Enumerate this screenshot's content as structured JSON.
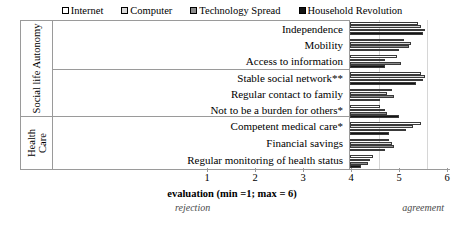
{
  "chart_data": {
    "type": "bar",
    "orientation": "horizontal",
    "title": "",
    "xlabel": "evaluation (min =1; max = 6)",
    "ylabel": "",
    "xlim": [
      1,
      6
    ],
    "xticks": [
      1,
      2,
      3,
      4,
      5,
      6
    ],
    "grid": true,
    "legend_position": "top",
    "scale_anchor_low": "rejection",
    "scale_anchor_high": "agreement",
    "groups": [
      {
        "name": "Social life Autonomy",
        "categories": [
          "Independence",
          "Mobility",
          "Access to information",
          "Stable social network**",
          "Regular contact to family",
          "Not to be a burden for others*"
        ]
      },
      {
        "name": "Health Care",
        "categories": [
          "Competent medical care*",
          "Financial savings",
          "Regular monitoring of health status"
        ]
      }
    ],
    "group_label_lines": [
      [
        "Social life Autonomy"
      ],
      [
        "Health",
        "Care"
      ]
    ],
    "categories": [
      "Independence",
      "Mobility",
      "Access to information",
      "Stable social network**",
      "Regular contact to family",
      "Not to be a burden for others*",
      "Competent medical care*",
      "Financial savings",
      "Regular monitoring of health status"
    ],
    "series": [
      {
        "name": "Internet",
        "color": "#ffffff",
        "values": [
          5.4,
          5.1,
          4.95,
          5.45,
          4.85,
          4.6,
          5.45,
          4.8,
          4.45
        ]
      },
      {
        "name": "Computer",
        "color": "#d9d9d9",
        "values": [
          5.45,
          5.25,
          4.7,
          5.55,
          4.75,
          4.7,
          5.3,
          4.85,
          4.4
        ]
      },
      {
        "name": "Technology Spread",
        "color": "#8c8c8c",
        "values": [
          5.55,
          5.2,
          5.05,
          5.5,
          4.9,
          4.75,
          5.15,
          4.9,
          4.35
        ]
      },
      {
        "name": "Household Revolution",
        "color": "#141414",
        "values": [
          5.5,
          5.0,
          4.7,
          5.35,
          4.6,
          5.0,
          4.8,
          4.7,
          4.2
        ]
      }
    ]
  },
  "legend": {
    "items": [
      {
        "label": "Internet",
        "swatch": "#ffffff"
      },
      {
        "label": "Computer",
        "swatch": "#d9d9d9"
      },
      {
        "label": "Technology Spread",
        "swatch": "#8c8c8c"
      },
      {
        "label": "Household Revolution",
        "swatch": "#141414"
      }
    ]
  },
  "axis": {
    "title": "evaluation (min =1; max = 6)",
    "ticks": [
      "1",
      "2",
      "3",
      "4",
      "5",
      "6"
    ],
    "anchor_left": "rejection",
    "anchor_right": "agreement"
  }
}
